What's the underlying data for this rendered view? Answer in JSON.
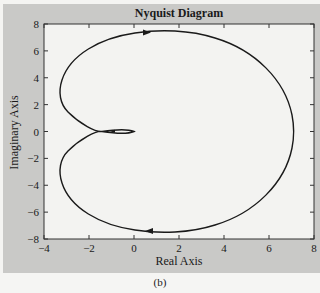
{
  "figure": {
    "title": "Nyquist Diagram",
    "xlabel": "Real Axis",
    "ylabel": "Imaginary Axis",
    "caption": "(b)"
  },
  "chart_data": {
    "type": "line",
    "title": "Nyquist Diagram",
    "xlabel": "Real Axis",
    "ylabel": "Imaginary Axis",
    "xlim": [
      -4,
      8
    ],
    "ylim": [
      -8,
      8
    ],
    "xticks": [
      -4,
      -2,
      0,
      2,
      4,
      6,
      8
    ],
    "yticks": [
      -8,
      -6,
      -4,
      -2,
      0,
      2,
      4,
      6,
      8
    ],
    "grid": false,
    "legend": null,
    "series": [
      {
        "name": "Nyquist contour (positive frequencies)",
        "direction_arrow": "right, near top (re≈0.6, im≈7.4)",
        "points": [
          [
            0,
            0
          ],
          [
            -0.5,
            0.1
          ],
          [
            -1.5,
            0.05
          ],
          [
            -2.5,
            0.9
          ],
          [
            -3.2,
            2.5
          ],
          [
            -3.3,
            3.3
          ],
          [
            -3.1,
            4.6
          ],
          [
            -2.0,
            6.3
          ],
          [
            0.0,
            7.3
          ],
          [
            1.2,
            7.5
          ],
          [
            3.0,
            7.1
          ],
          [
            5.0,
            5.6
          ],
          [
            6.5,
            3.0
          ],
          [
            7.1,
            0.0
          ]
        ]
      },
      {
        "name": "Nyquist contour (negative frequencies, mirror)",
        "direction_arrow": "left, near bottom (re≈0.6, im≈-7.4)",
        "points": [
          [
            7.1,
            0.0
          ],
          [
            6.5,
            -3.0
          ],
          [
            5.0,
            -5.6
          ],
          [
            3.0,
            -7.1
          ],
          [
            1.2,
            -7.5
          ],
          [
            0.0,
            -7.3
          ],
          [
            -2.0,
            -6.3
          ],
          [
            -3.1,
            -4.6
          ],
          [
            -3.3,
            -3.3
          ],
          [
            -3.2,
            -2.5
          ],
          [
            -2.5,
            -0.9
          ],
          [
            -1.5,
            -0.05
          ],
          [
            -0.5,
            -0.1
          ],
          [
            0,
            0
          ]
        ]
      }
    ],
    "annotations": [
      "small loop near origin between re≈-1.5 and re≈0"
    ],
    "caption": "(b)"
  }
}
